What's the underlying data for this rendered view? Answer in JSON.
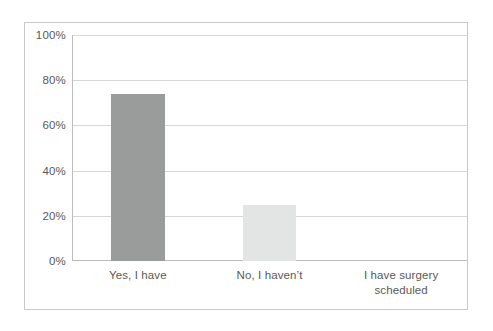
{
  "chart_data": {
    "type": "bar",
    "title": "",
    "subtitle": "",
    "xlabel": "",
    "ylabel": "",
    "categories": [
      "Yes, I have",
      "No, I haven’t",
      "I have surgery scheduled"
    ],
    "category_lines": [
      [
        "Yes, I have"
      ],
      [
        "No, I haven’t"
      ],
      [
        "I have surgery",
        "scheduled"
      ]
    ],
    "values": [
      74,
      25,
      0
    ],
    "value_labels": [
      "74%",
      "25%",
      "0%"
    ],
    "ylim": [
      0,
      100
    ],
    "ytick_values": [
      0,
      20,
      40,
      60,
      80,
      100
    ],
    "ytick_labels": [
      "0%",
      "20%",
      "40%",
      "60%",
      "80%",
      "100%"
    ],
    "grid": true,
    "legend": false,
    "legend_position": "none",
    "bar_colors": [
      "#9a9b9b",
      "#e3e4e4",
      "#e3e4e4"
    ],
    "colors": {
      "bar_dark": "#9a9b9b",
      "bar_light": "#e3e4e4",
      "gridline": "#d6d6d6",
      "axis_line": "#bdbdbd",
      "frame_border": "#c9c9c9",
      "tick_text": "#595959",
      "plot_background": "#ffffff"
    }
  }
}
